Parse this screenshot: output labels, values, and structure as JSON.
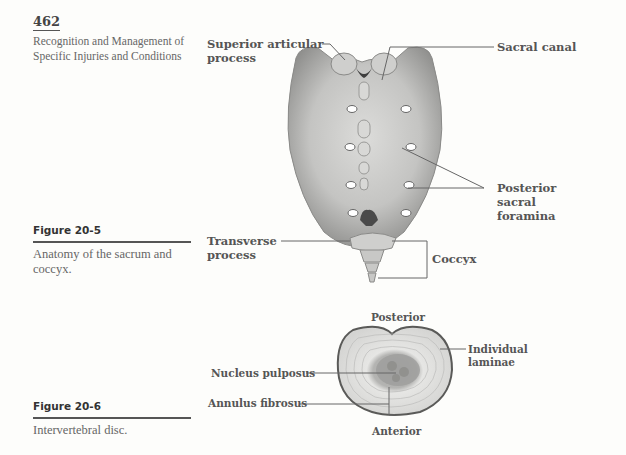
{
  "page": {
    "number": "462",
    "running_head": "Recognition and Management of Specific Injuries and Conditions"
  },
  "figures": [
    {
      "label": "Figure 20-5",
      "caption": "Anatomy of the sacrum and coccyx.",
      "annotations": {
        "superior_articular_process": "Superior articular process",
        "sacral_canal": "Sacral canal",
        "posterior_sacral_foramina": "Posterior sacral foramina",
        "transverse_process": "Transverse process",
        "coccyx": "Coccyx"
      }
    },
    {
      "label": "Figure 20-6",
      "caption": "Intervertebral disc.",
      "annotations": {
        "posterior": "Posterior",
        "anterior": "Anterior",
        "nucleus_pulposus": "Nucleus pulposus",
        "annulus_fibrosus": "Annulus fibrosus",
        "individual_laminae": "Individual laminae"
      }
    }
  ],
  "colors": {
    "page_bg": "#fdfdfb",
    "bone_light": "#e4e4e2",
    "bone_mid": "#b8b8b6",
    "bone_dark": "#7a7a78",
    "leader_line": "#666666",
    "text": "#555555"
  }
}
